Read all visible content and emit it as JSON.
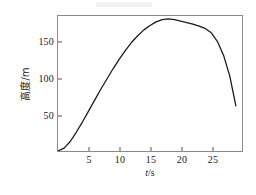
{
  "figure": {
    "background_color": "#ffffff",
    "frame_color": "#8a8a8a",
    "curve_color": "#1a1a1a"
  },
  "chart_data": {
    "type": "line",
    "title": "",
    "subtitle": "",
    "xlabel": "t/s",
    "xlabel_symbol": "t",
    "xlabel_unit": "/s",
    "ylabel": "高度/m",
    "ylabel_symbol": "高度",
    "ylabel_unit": "/m",
    "xlim": [
      0,
      30
    ],
    "ylim": [
      0,
      185
    ],
    "xticks": [
      5,
      10,
      15,
      20,
      25
    ],
    "yticks": [
      50,
      100,
      150
    ],
    "xtick_labels": [
      "5",
      "10",
      "15",
      "20",
      "25"
    ],
    "ytick_labels": [
      "50",
      "100",
      "150"
    ],
    "grid": false,
    "legend": false,
    "legend_position": "none",
    "series": [
      {
        "name": "高度",
        "x": [
          0,
          1,
          2,
          3,
          4,
          5,
          6,
          7,
          8,
          9,
          10,
          11,
          12,
          13,
          14,
          15,
          16,
          17,
          18,
          19,
          20,
          21,
          22,
          23,
          24,
          25,
          26,
          27,
          28,
          29
        ],
        "values": [
          0,
          4,
          13,
          26,
          40,
          55,
          70,
          85,
          99,
          113,
          126,
          138,
          149,
          158,
          166,
          172,
          177,
          180,
          181,
          180,
          178,
          176,
          174,
          171,
          168,
          162,
          150,
          131,
          103,
          62
        ]
      }
    ],
    "annotations": [
      {
        "label": "peak",
        "x": 18,
        "y": 181
      },
      {
        "label": "start",
        "x": 0,
        "y": 0
      },
      {
        "label": "end",
        "x": 29,
        "y": 62
      }
    ]
  },
  "axes": {
    "y": {
      "ticks": [
        {
          "value": 50,
          "label": "50"
        },
        {
          "value": 100,
          "label": "100"
        },
        {
          "value": 150,
          "label": "150"
        }
      ],
      "title": "高度/m"
    },
    "x": {
      "ticks": [
        {
          "value": 5,
          "label": "5"
        },
        {
          "value": 10,
          "label": "10"
        },
        {
          "value": 15,
          "label": "15"
        },
        {
          "value": 20,
          "label": "20"
        },
        {
          "value": 25,
          "label": "25"
        }
      ],
      "title_symbol": "t",
      "title_unit": "/s"
    }
  }
}
